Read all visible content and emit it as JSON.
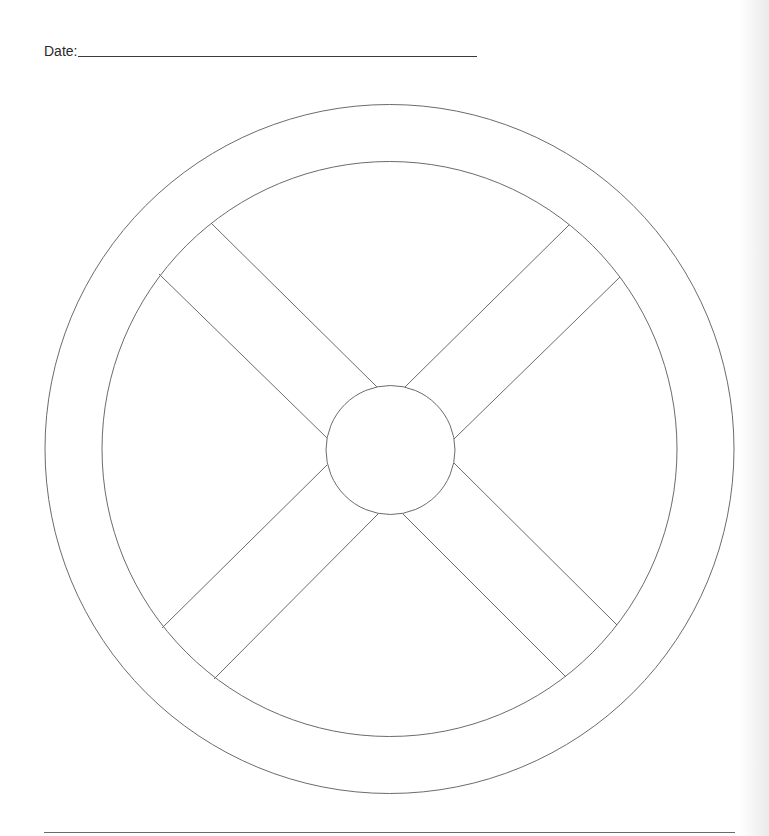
{
  "worksheet": {
    "date_label": "Date:",
    "date_value": ""
  },
  "wheel": {
    "stroke_color": "#6b6b6b",
    "center": [
      389.5,
      449
    ],
    "outer_radius": 344.5,
    "inner_radius": 287.5,
    "hub": {
      "center": [
        390.5,
        450
      ],
      "radius": 64.5
    },
    "spokes": [
      {
        "name": "upper-left",
        "lines": [
          [
            211,
            223,
            377,
            387
          ],
          [
            159,
            274,
            327,
            438
          ]
        ]
      },
      {
        "name": "upper-right",
        "lines": [
          [
            569,
            225,
            405,
            387
          ],
          [
            620,
            277,
            454,
            439
          ]
        ]
      },
      {
        "name": "lower-left",
        "lines": [
          [
            162,
            628,
            327,
            465
          ],
          [
            214,
            679,
            378,
            514
          ]
        ]
      },
      {
        "name": "lower-right",
        "lines": [
          [
            617,
            625,
            454,
            463
          ],
          [
            566,
            677,
            403,
            514
          ]
        ]
      }
    ]
  }
}
